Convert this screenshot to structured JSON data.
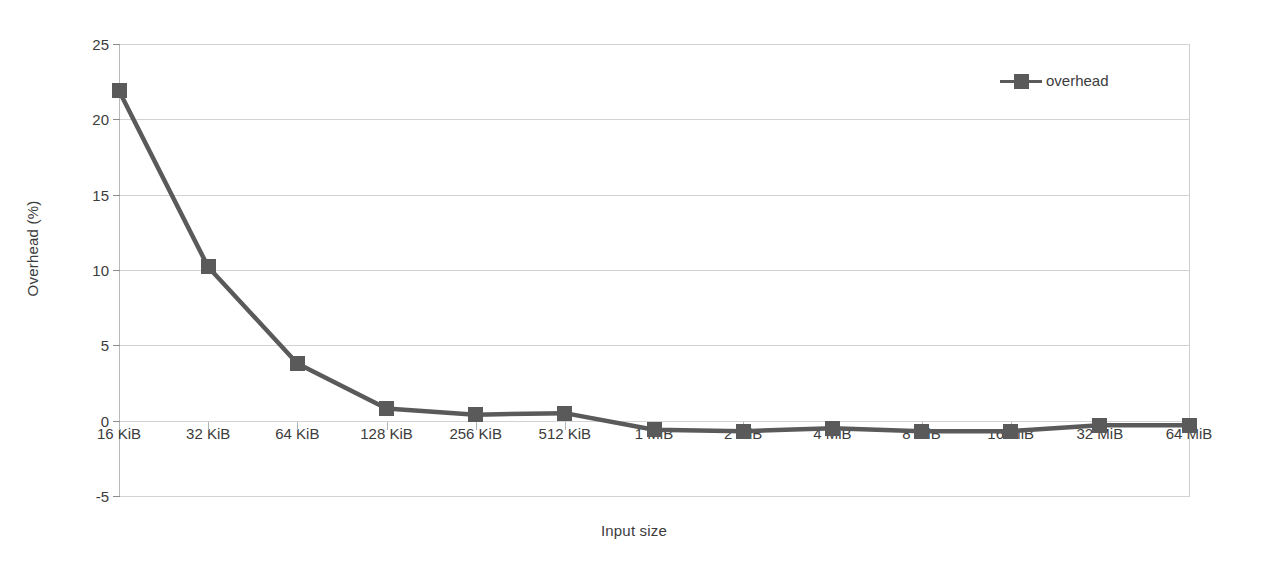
{
  "chart_data": {
    "type": "line",
    "title": "",
    "xlabel": "Input size",
    "ylabel": "Overhead (%)",
    "categories": [
      "16 KiB",
      "32 KiB",
      "64 KiB",
      "128 KiB",
      "256 KiB",
      "512 KiB",
      "1 MiB",
      "2 MiB",
      "4 MiB",
      "8 MiB",
      "16 MiB",
      "32 MiB",
      "64 MiB"
    ],
    "series": [
      {
        "name": "overhead",
        "values": [
          21.9,
          10.2,
          3.8,
          0.8,
          0.4,
          0.5,
          -0.6,
          -0.7,
          -0.5,
          -0.7,
          -0.7,
          -0.3,
          -0.3
        ]
      }
    ],
    "ylim": [
      -5,
      25
    ],
    "yticks": [
      25,
      20,
      15,
      10,
      5,
      0,
      -5
    ],
    "ytick_labels": [
      "25",
      "20",
      "15",
      "10",
      "5",
      "0",
      "-5"
    ],
    "grid": true,
    "legend_position": "top-right",
    "colors": {
      "series": "#5a5a5a",
      "gridline": "#d2d2d2",
      "axis": "#b8b8b8",
      "text": "#3c3c3c"
    }
  },
  "legend": {
    "entries": [
      {
        "label": "overhead",
        "marker": "square-line-marker"
      }
    ]
  }
}
